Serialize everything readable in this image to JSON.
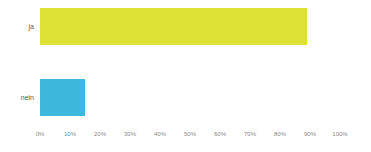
{
  "chart_data": {
    "type": "bar",
    "orientation": "horizontal",
    "title": "",
    "subtitle": "",
    "xlabel": "",
    "ylabel": "",
    "categories": [
      "ja",
      "nein"
    ],
    "values": [
      89,
      15
    ],
    "value_suffix": "%",
    "colors": [
      "#dde135",
      "#3bb8dc"
    ],
    "xlim": [
      0,
      100
    ],
    "xticks": [
      0,
      10,
      20,
      30,
      40,
      50,
      60,
      70,
      80,
      90,
      100
    ],
    "xtick_labels": [
      "0%",
      "10%",
      "20%",
      "30%",
      "40%",
      "50%",
      "60%",
      "70%",
      "80%",
      "90%",
      "100%"
    ],
    "grid": false,
    "legend": false,
    "legend_position": "none",
    "background_color": "#ffffff",
    "tick_label_color": "#8a8a8a",
    "category_label_color": "#5b5b5b",
    "series": [
      {
        "name": "Antwort",
        "values": [
          89,
          15
        ]
      }
    ]
  }
}
